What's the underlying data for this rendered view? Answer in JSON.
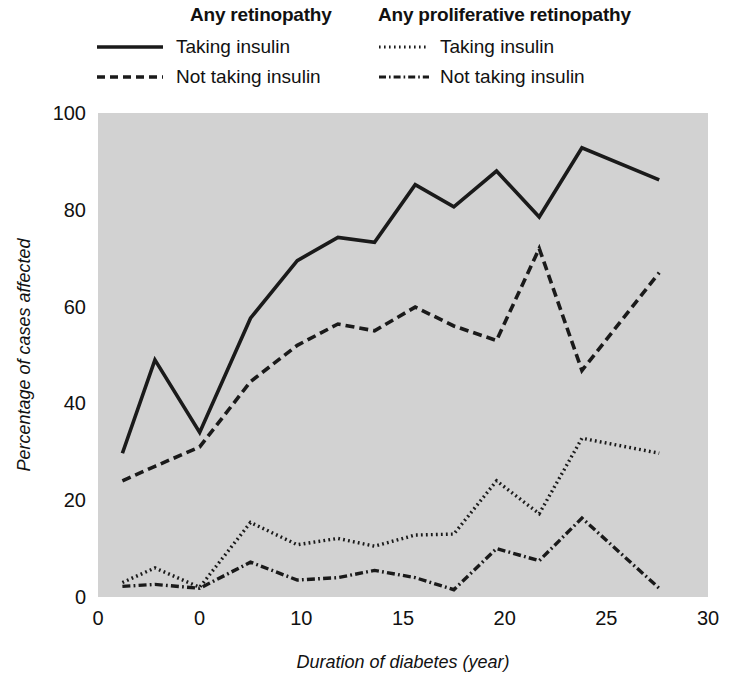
{
  "legend": {
    "groups": [
      {
        "title": "Any retinopathy",
        "entries": [
          {
            "label": "Taking insulin",
            "style": "solid",
            "swatch": "solid-line-swatch"
          },
          {
            "label": "Not taking insulin",
            "style": "dashed",
            "swatch": "dashed-line-swatch"
          }
        ]
      },
      {
        "title": "Any proliferative retinopathy",
        "entries": [
          {
            "label": "Taking insulin",
            "style": "dotted",
            "swatch": "dotted-line-swatch"
          },
          {
            "label": "Not taking insulin",
            "style": "dashdot",
            "swatch": "dashdot-line-swatch"
          }
        ]
      }
    ]
  },
  "colors": {
    "plot_background": "#d2d2d2",
    "line": "#1a1a1a",
    "text": "#111111",
    "page_background": "#ffffff"
  },
  "chart_data": {
    "type": "line",
    "title": "",
    "xlabel": "Duration of diabetes (year)",
    "ylabel": "Percentage of cases affected",
    "xlim": [
      0,
      30
    ],
    "ylim": [
      0,
      100
    ],
    "xticks": [
      0,
      5,
      10,
      15,
      20,
      25,
      30
    ],
    "xticklabels": [
      "0",
      "0",
      "10",
      "15",
      "20",
      "25",
      "30"
    ],
    "yticks": [
      0,
      20,
      40,
      60,
      80,
      100
    ],
    "yticklabels": [
      "0",
      "20",
      "40",
      "60",
      "80",
      "100"
    ],
    "grid": false,
    "legend_position": "above-plot",
    "series": [
      {
        "name": "Any retinopathy — Taking insulin",
        "style": "solid",
        "x": [
          1.2,
          2.8,
          5.0,
          7.5,
          9.8,
          11.8,
          13.6,
          15.6,
          17.5,
          19.6,
          21.7,
          23.8,
          27.6
        ],
        "values": [
          29.7,
          49.0,
          34.0,
          57.6,
          69.5,
          74.3,
          73.3,
          85.2,
          80.6,
          88.0,
          78.5,
          92.8,
          86.2
        ]
      },
      {
        "name": "Any retinopathy — Not taking insulin",
        "style": "dashed",
        "x": [
          1.2,
          2.8,
          5.0,
          7.5,
          9.8,
          11.8,
          13.6,
          15.6,
          17.5,
          19.6,
          21.7,
          23.8,
          27.6
        ],
        "values": [
          24.0,
          27.0,
          31.0,
          44.5,
          52.0,
          56.4,
          55.0,
          59.9,
          56.0,
          53.0,
          72.0,
          46.8,
          67.0
        ]
      },
      {
        "name": "Any proliferative retinopathy — Taking insulin",
        "style": "dotted",
        "x": [
          1.2,
          2.8,
          5.0,
          7.5,
          9.8,
          11.8,
          13.6,
          15.6,
          17.5,
          19.6,
          21.7,
          23.8,
          27.6
        ],
        "values": [
          3.0,
          6.0,
          2.0,
          15.4,
          10.8,
          12.1,
          10.5,
          12.8,
          13.0,
          24.0,
          17.2,
          32.8,
          29.7
        ]
      },
      {
        "name": "Any proliferative retinopathy — Not taking insulin",
        "style": "dashdot",
        "x": [
          1.2,
          2.8,
          5.0,
          7.5,
          9.8,
          11.8,
          13.6,
          15.6,
          17.5,
          19.6,
          21.7,
          23.8,
          27.6
        ],
        "values": [
          2.2,
          2.6,
          1.8,
          7.2,
          3.5,
          4.0,
          5.5,
          4.0,
          1.5,
          10.0,
          7.5,
          16.3,
          1.8
        ]
      }
    ]
  },
  "plot_geometry": {
    "left": 98,
    "right": 708,
    "top": 113,
    "bottom": 597
  }
}
